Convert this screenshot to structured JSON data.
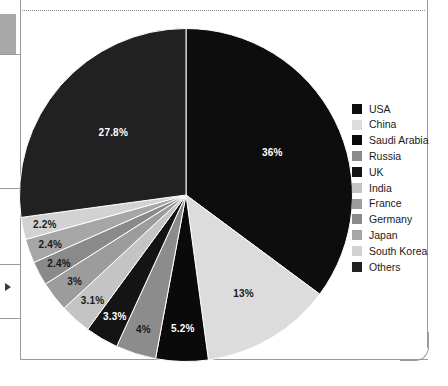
{
  "page": {
    "edge_marker_icon": "right-arrow-marker-icon",
    "dotted_rule_icon": "dotted-divider-icon"
  },
  "chart_data": {
    "type": "pie",
    "title": "",
    "subtitle": "",
    "xlabel": "",
    "ylabel": "",
    "start_angle_oclock": 12,
    "direction": "clockwise",
    "grid": false,
    "legend_position": "right",
    "units": "percent",
    "categories": [
      "USA",
      "China",
      "Saudi Arabia",
      "Russia",
      "UK",
      "India",
      "France",
      "Germany",
      "Japan",
      "South Korea",
      "Others"
    ],
    "values": [
      36,
      13,
      5.2,
      4,
      3.3,
      3.1,
      3,
      2.4,
      2.4,
      2.2,
      27.8
    ],
    "labels": [
      "36%",
      "13%",
      "5.2%",
      "4%",
      "3.3%",
      "3.1%",
      "3%",
      "2.4%",
      "2.4%",
      "2.2%",
      "27.8%"
    ],
    "colors": [
      "#0d0d0d",
      "#dcdcdc",
      "#0a0a0a",
      "#8c8c8c",
      "#141414",
      "#c4c4c4",
      "#9c9c9c",
      "#8a8a8a",
      "#a6a6a6",
      "#d2d2d2",
      "#212121"
    ],
    "label_text_colors": [
      "#ffffff",
      "#1a1a1a",
      "#ffffff",
      "#1a1a1a",
      "#ffffff",
      "#1a1a1a",
      "#1a1a1a",
      "#1a1a1a",
      "#1a1a1a",
      "#1a1a1a",
      "#ffffff"
    ],
    "slices": [
      {
        "name": "USA",
        "value": 36,
        "label": "36%",
        "color": "#0d0d0d"
      },
      {
        "name": "China",
        "value": 13,
        "label": "13%",
        "color": "#dcdcdc"
      },
      {
        "name": "Saudi Arabia",
        "value": 5.2,
        "label": "5.2%",
        "color": "#0a0a0a"
      },
      {
        "name": "Russia",
        "value": 4,
        "label": "4%",
        "color": "#8c8c8c"
      },
      {
        "name": "UK",
        "value": 3.3,
        "label": "3.3%",
        "color": "#141414"
      },
      {
        "name": "India",
        "value": 3.1,
        "label": "3.1%",
        "color": "#c4c4c4"
      },
      {
        "name": "France",
        "value": 3,
        "label": "3%",
        "color": "#9c9c9c"
      },
      {
        "name": "Germany",
        "value": 2.4,
        "label": "2.4%",
        "color": "#8a8a8a"
      },
      {
        "name": "Japan",
        "value": 2.4,
        "label": "2.4%",
        "color": "#a6a6a6"
      },
      {
        "name": "South Korea",
        "value": 2.2,
        "label": "2.2%",
        "color": "#d2d2d2"
      },
      {
        "name": "Others",
        "value": 27.8,
        "label": "27.8%",
        "color": "#212121"
      }
    ]
  },
  "legend": {
    "items": [
      {
        "label": "USA",
        "color": "#0d0d0d"
      },
      {
        "label": "China",
        "color": "#dcdcdc"
      },
      {
        "label": "Saudi Arabia",
        "color": "#0a0a0a"
      },
      {
        "label": "Russia",
        "color": "#8c8c8c"
      },
      {
        "label": "UK",
        "color": "#141414"
      },
      {
        "label": "India",
        "color": "#c4c4c4"
      },
      {
        "label": "France",
        "color": "#9c9c9c"
      },
      {
        "label": "Germany",
        "color": "#8a8a8a"
      },
      {
        "label": "Japan",
        "color": "#a6a6a6"
      },
      {
        "label": "South Korea",
        "color": "#d2d2d2"
      },
      {
        "label": "Others",
        "color": "#212121"
      }
    ]
  }
}
